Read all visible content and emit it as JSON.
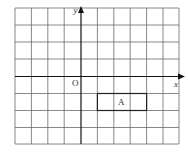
{
  "diagram": {
    "type": "coordinate-grid",
    "grid": {
      "columns": 10,
      "rows": 8,
      "x_range": [
        -4,
        6
      ],
      "y_range": [
        -4,
        4
      ],
      "line_color": "#555555",
      "axis_color": "#111111"
    },
    "axes": {
      "x_label": "x",
      "y_label": "y",
      "origin_label": "O"
    },
    "shapes": [
      {
        "label": "A",
        "type": "rectangle",
        "x_min": 1,
        "x_max": 4,
        "y_min": -2,
        "y_max": -1
      }
    ]
  }
}
